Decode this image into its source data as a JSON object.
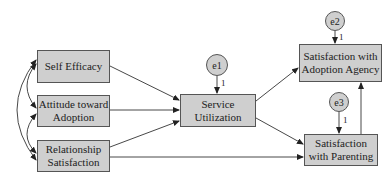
{
  "diagram": {
    "type": "structural-equation-model",
    "nodes": {
      "self_efficacy": {
        "label": "Self Efficacy"
      },
      "attitude": {
        "label": "Attitude toward Adoption"
      },
      "relationship": {
        "label": "Relationship Satisfaction"
      },
      "service": {
        "label": "Service Utilization"
      },
      "agency": {
        "label": "Satisfaction with Adoption Agency"
      },
      "parenting": {
        "label": "Satisfaction with Parenting"
      }
    },
    "errors": {
      "e1": {
        "label": "e1",
        "weight": "1"
      },
      "e2": {
        "label": "e2",
        "weight": "1"
      },
      "e3": {
        "label": "e3",
        "weight": "1"
      }
    },
    "paths": [
      {
        "from": "Self Efficacy",
        "to": "Service Utilization"
      },
      {
        "from": "Attitude toward Adoption",
        "to": "Service Utilization"
      },
      {
        "from": "Relationship Satisfaction",
        "to": "Service Utilization"
      },
      {
        "from": "Relationship Satisfaction",
        "to": "Satisfaction with Parenting"
      },
      {
        "from": "Service Utilization",
        "to": "Satisfaction with Adoption Agency"
      },
      {
        "from": "Service Utilization",
        "to": "Satisfaction with Parenting"
      },
      {
        "from": "Satisfaction with Parenting",
        "to": "Satisfaction with Adoption Agency"
      },
      {
        "from": "e1",
        "to": "Service Utilization"
      },
      {
        "from": "e2",
        "to": "Satisfaction with Adoption Agency"
      },
      {
        "from": "e3",
        "to": "Satisfaction with Parenting"
      }
    ],
    "covariances": [
      [
        "Self Efficacy",
        "Attitude toward Adoption"
      ],
      [
        "Attitude toward Adoption",
        "Relationship Satisfaction"
      ],
      [
        "Self Efficacy",
        "Relationship Satisfaction"
      ]
    ],
    "colors": {
      "box_fill": "#cfcfcf",
      "stroke": "#555555"
    }
  }
}
